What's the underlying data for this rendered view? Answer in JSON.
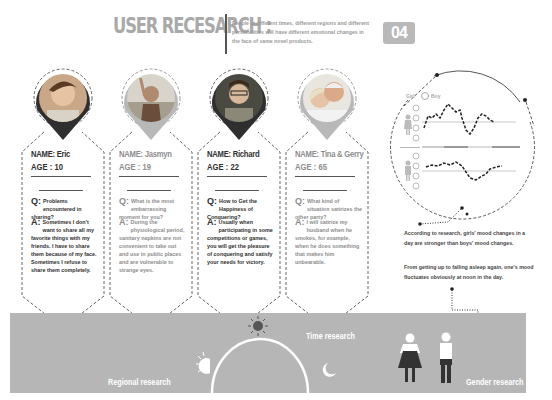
{
  "header": {
    "title": "USER RECESARCH :",
    "description": "People at different times, different regions and different personalities will have different emotional changes in the face of same novel products.",
    "badge": "04"
  },
  "personas": [
    {
      "name": "NAME: Eric",
      "age": "AGE : 10",
      "q_mark": "Q:",
      "question": "Problems encountered in sharing?",
      "a_mark": "A:",
      "answer": "Sometimes I don't want to share all my favorite things with my friends. I have to share them because of my face. Sometimes I refuse to share them completely.",
      "pin_color": "#2f2f2f"
    },
    {
      "name": "NAME: Jasmyn",
      "age": "AGE : 19",
      "q_mark": "Q:",
      "question": "What is the most embarrassing moment for you?",
      "a_mark": "A:",
      "answer": "During the physiological period, sanitary napkins are not convenient to take out and use in public places and are vulnerable to strange eyes.",
      "pin_color": "#b8b8b8"
    },
    {
      "name": "NAME: Richard",
      "age": "AGE : 22",
      "q_mark": "Q:",
      "question": "How to Get the Happiness of Conquering?",
      "a_mark": "A:",
      "answer": "Usually when participating in some competitions or games, you will get the pleasure of conquering and satisfy your needs for victory.",
      "pin_color": "#2f2f2f"
    },
    {
      "name": "NAME: Tina  &  Gerry",
      "age": "AGE : 65",
      "q_mark": "Q:",
      "question": "What kind of situation satirizes the other party?",
      "a_mark": "A:",
      "answer": "I will satirize my husband when he smokes, for example, when he does something that makes him unbearable.",
      "pin_color": "#b8b8b8"
    }
  ],
  "mood_chart": {
    "legend_left": "Girl",
    "legend_right": "Boy",
    "divider_label": "center"
  },
  "notes": [
    "According to research, girls' mood changes in a day are stronger than boys' mood changes.",
    "From getting up to falling asleep again, one's mood fluctuates obviously at noon in the day."
  ],
  "bottom": {
    "regional": "Regional research",
    "time": "Time research",
    "gender": "Gender research"
  },
  "colors": {
    "dark": "#2f2f2f",
    "light": "#b8b8b8",
    "band": "#b6b6b6"
  }
}
